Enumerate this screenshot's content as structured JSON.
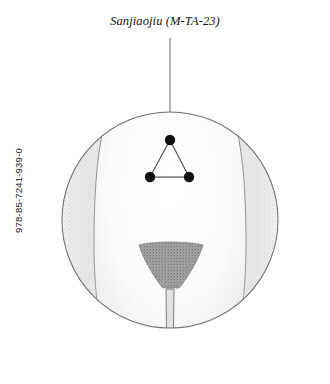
{
  "page": {
    "background_color": "#ffffff",
    "width": 330,
    "height": 384
  },
  "isbn": {
    "text": "978-85-7241-939-0",
    "orientation": "vertical-rotated-90ccw",
    "color": "#1b1b1b"
  },
  "label": {
    "point_name": "Sanjiaojiu",
    "point_code": "(M-TA-23)",
    "full_text": "Sanjiaojiu (M-TA-23)",
    "style": "italic",
    "color": "#111111"
  },
  "illustration": {
    "subject": "lower abdomen acupuncture point location",
    "view": "circular detail inset",
    "circle": {
      "center_x": 170,
      "center_y": 220,
      "radius": 108,
      "stroke_color": "#6e6e6e",
      "fill_color": "#ffffff"
    },
    "leader_line": {
      "from_x": 170,
      "from_y": 38,
      "to_x": 170,
      "to_y": 140,
      "color": "#7a7a7a"
    },
    "shading": {
      "side_gray": "#d9d9d9",
      "stipple_gray": "#b9b9b9",
      "pubic_triangle_gray": "#9a9a9a",
      "outline_gray": "#5a5a5a"
    },
    "points": [
      {
        "name": "apex-point",
        "x": 170,
        "y": 140,
        "r": 5.2
      },
      {
        "name": "bottom-left-point",
        "x": 150,
        "y": 177,
        "r": 5.2
      },
      {
        "name": "bottom-right-point",
        "x": 189,
        "y": 177,
        "r": 5.2
      }
    ],
    "point_marker_color": "#111111",
    "connector_color": "#555555",
    "point_count": 3,
    "arrangement": "equilateral-triangle"
  }
}
